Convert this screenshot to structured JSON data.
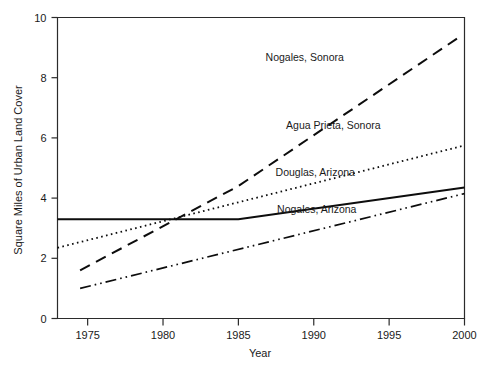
{
  "chart_data": {
    "type": "line",
    "title": "",
    "xlabel": "Year",
    "ylabel": "Square Miles of Urban Land Cover",
    "xlim": [
      1973,
      2000
    ],
    "ylim": [
      0,
      10
    ],
    "xticks": [
      1975,
      1980,
      1985,
      1990,
      1995,
      2000
    ],
    "yticks": [
      0,
      2,
      4,
      6,
      8,
      10
    ],
    "grid": false,
    "legend_position": "inline-annotations",
    "series": [
      {
        "name": "Nogales, Sonora",
        "style": "dashed",
        "label_x": 1989.4,
        "label_y": 8.55,
        "x": [
          1974.5,
          1985,
          1999.5
        ],
        "values": [
          1.6,
          4.4,
          9.3
        ]
      },
      {
        "name": "Agua Prieta, Sonora",
        "style": "dotted",
        "label_x": 1991.3,
        "label_y": 6.3,
        "x": [
          1973,
          2000
        ],
        "values": [
          2.35,
          5.75
        ]
      },
      {
        "name": "Douglas, Arizona",
        "style": "solid",
        "label_x": 1990.1,
        "label_y": 4.75,
        "x": [
          1973,
          1985,
          2000
        ],
        "values": [
          3.3,
          3.3,
          4.35
        ]
      },
      {
        "name": "Nogales, Arizona",
        "style": "dashdotdot",
        "label_x": 1990.2,
        "label_y": 3.5,
        "x": [
          1974.5,
          2000
        ],
        "values": [
          1.0,
          4.15
        ]
      }
    ]
  },
  "axes": {
    "x_tick_labels": [
      "1975",
      "1980",
      "1985",
      "1990",
      "1995",
      "2000"
    ],
    "y_tick_labels": [
      "0",
      "2",
      "4",
      "6",
      "8",
      "10"
    ],
    "x_axis_title": "Year",
    "y_axis_title": "Square Miles of Urban Land Cover"
  },
  "colors": {
    "line": "#0d0d0d",
    "axis": "#2b2b2b",
    "text": "#1a1a1a",
    "background": "#ffffff"
  }
}
